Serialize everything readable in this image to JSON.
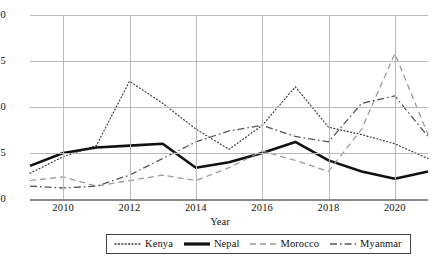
{
  "chart_data": {
    "type": "line",
    "title": "",
    "xlabel": "Year",
    "ylabel": "",
    "xlim": [
      2009,
      2021
    ],
    "ylim": [
      0,
      100
    ],
    "grid": true,
    "legend_position": "bottom",
    "x": [
      2009,
      2010,
      2011,
      2012,
      2013,
      2014,
      2015,
      2016,
      2017,
      2018,
      2019,
      2020,
      2021
    ],
    "xticks": [
      "2010",
      "2012",
      "2014",
      "2016",
      "2018",
      "2020"
    ],
    "xtick_values": [
      2010,
      2012,
      2014,
      2016,
      2018,
      2020
    ],
    "yticks": [
      "0",
      "25",
      "50",
      "75",
      "100"
    ],
    "ytick_values": [
      0,
      25,
      50,
      75,
      100
    ],
    "series": [
      {
        "name": "Kenya",
        "style": "dotted",
        "color": "#333333",
        "values": [
          14,
          23,
          29,
          64,
          52,
          38,
          27,
          40,
          61,
          39,
          35,
          30,
          22
        ]
      },
      {
        "name": "Nepal",
        "style": "solid",
        "color": "#111111",
        "values": [
          18,
          25,
          28,
          29,
          30,
          17,
          20,
          25,
          31,
          21,
          15,
          11,
          15
        ]
      },
      {
        "name": "Morocco",
        "style": "dashed",
        "color": "#9a9a9a",
        "values": [
          10,
          12,
          7,
          10,
          13,
          10,
          17,
          26,
          21,
          15,
          38,
          79,
          35
        ]
      },
      {
        "name": "Myanmar",
        "style": "dashdot",
        "color": "#555555",
        "values": [
          7,
          6,
          7,
          13,
          22,
          31,
          37,
          40,
          34,
          31,
          52,
          56,
          34
        ]
      }
    ]
  },
  "legend": {
    "items": [
      {
        "label": "Kenya"
      },
      {
        "label": "Nepal"
      },
      {
        "label": "Morocco"
      },
      {
        "label": "Myanmar"
      }
    ]
  },
  "axis": {
    "x_title": "Year"
  }
}
